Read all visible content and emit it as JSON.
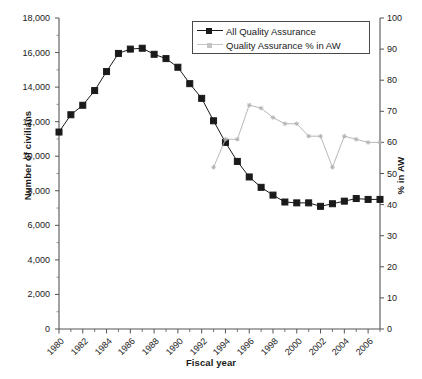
{
  "chart_data": {
    "type": "line",
    "title": "",
    "xlabel": "Fiscal year",
    "ylabel": "Number of civilians",
    "y2label": "% in AW",
    "grid": false,
    "legend_position": "top-right",
    "x": [
      1980,
      1981,
      1982,
      1983,
      1984,
      1985,
      1986,
      1987,
      1988,
      1989,
      1990,
      1991,
      1992,
      1993,
      1994,
      1995,
      1996,
      1997,
      1998,
      1999,
      2000,
      2001,
      2002,
      2003,
      2004,
      2005,
      2006,
      2007
    ],
    "xlim": [
      1980,
      2007
    ],
    "xtick_labels": [
      "1980",
      "1982",
      "1984",
      "1986",
      "1988",
      "1990",
      "1992",
      "1994",
      "1996",
      "1998",
      "2000",
      "2002",
      "2004",
      "2006"
    ],
    "xtick_values": [
      1980,
      1982,
      1984,
      1986,
      1988,
      1990,
      1992,
      1994,
      1996,
      1998,
      2000,
      2002,
      2004,
      2006
    ],
    "ylim": [
      0,
      18000
    ],
    "ytick_labels": [
      "0",
      "2,000",
      "4,000",
      "6,000",
      "8,000",
      "10,000",
      "12,000",
      "14,000",
      "16,000",
      "18,000"
    ],
    "ytick_values": [
      0,
      2000,
      4000,
      6000,
      8000,
      10000,
      12000,
      14000,
      16000,
      18000
    ],
    "y2lim": [
      0,
      100
    ],
    "y2tick_labels": [
      "0",
      "10",
      "20",
      "30",
      "40",
      "50",
      "60",
      "70",
      "80",
      "90",
      "100"
    ],
    "y2tick_values": [
      0,
      10,
      20,
      30,
      40,
      50,
      60,
      70,
      80,
      90,
      100
    ],
    "series": [
      {
        "name": "All Quality Assurance",
        "axis": "left",
        "color": "#1a1a1a",
        "marker": "square",
        "x": [
          1980,
          1981,
          1982,
          1983,
          1984,
          1985,
          1986,
          1987,
          1988,
          1989,
          1990,
          1991,
          1992,
          1993,
          1994,
          1995,
          1996,
          1997,
          1998,
          1999,
          2000,
          2001,
          2002,
          2003,
          2004,
          2005,
          2006,
          2007
        ],
        "values": [
          11400,
          12400,
          12950,
          13800,
          14900,
          15950,
          16200,
          16250,
          15900,
          15650,
          15150,
          14200,
          13350,
          12050,
          10800,
          9700,
          8800,
          8200,
          7750,
          7350,
          7300,
          7300,
          7100,
          7250,
          7400,
          7550,
          7500,
          7500
        ]
      },
      {
        "name": "Quality Assurance % in AW",
        "axis": "right",
        "color": "#b0b0b0",
        "marker": "star",
        "x": [
          1993,
          1994,
          1995,
          1996,
          1997,
          1998,
          1999,
          2000,
          2001,
          2002,
          2003,
          2004,
          2005,
          2006,
          2007
        ],
        "values": [
          52,
          61,
          61,
          72,
          71,
          68,
          66,
          66,
          62,
          62,
          52,
          62,
          61,
          60,
          60
        ]
      }
    ]
  },
  "legend": {
    "items": [
      {
        "label": "All Quality Assurance"
      },
      {
        "label": "Quality Assurance % in AW"
      }
    ]
  },
  "axes": {
    "left_title": "Number of civilians",
    "right_title": "% in AW",
    "bottom_title": "Fiscal year"
  }
}
